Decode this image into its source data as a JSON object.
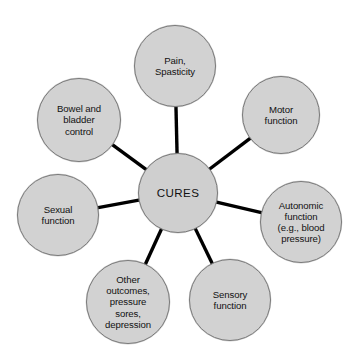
{
  "diagram": {
    "type": "hub-and-spoke",
    "colors": {
      "node_fill": "#d2d2d2",
      "node_stroke": "#7a7a7a",
      "spoke": "#000000",
      "background": "#ffffff",
      "text": "#111111"
    },
    "center": {
      "label": "CURES",
      "cx": 178,
      "cy": 193,
      "r": 40
    },
    "nodes": [
      {
        "id": "pain-spasticity",
        "label": "Pain,\nSpasticity",
        "lines": [
          "Pain,",
          "Spasticity"
        ],
        "cx": 175,
        "cy": 66,
        "r": 41
      },
      {
        "id": "motor-function",
        "label": "Motor\nfunction",
        "lines": [
          "Motor",
          "function"
        ],
        "cx": 281,
        "cy": 115,
        "r": 39
      },
      {
        "id": "autonomic-function",
        "label": "Autonomic\nfunction\n(e.g., blood\npressure)",
        "lines": [
          "Autonomic",
          "function",
          "(e.g., blood",
          "pressure)"
        ],
        "cx": 301,
        "cy": 222,
        "r": 41
      },
      {
        "id": "sensory-function",
        "label": "Sensory\nfunction",
        "lines": [
          "Sensory",
          "function"
        ],
        "cx": 230,
        "cy": 300,
        "r": 41
      },
      {
        "id": "other-outcomes",
        "label": "Other\noutcomes,\npressure\nsores,\ndepression",
        "lines": [
          "Other",
          "outcomes,",
          "pressure",
          "sores,",
          "depression"
        ],
        "cx": 128,
        "cy": 302,
        "r": 42
      },
      {
        "id": "sexual-function",
        "label": "Sexual\nfunction",
        "lines": [
          "Sexual",
          "function"
        ],
        "cx": 58,
        "cy": 215,
        "r": 41
      },
      {
        "id": "bowel-bladder-control",
        "label": "Bowel and\nbladder\ncontrol",
        "lines": [
          "Bowel and",
          "bladder",
          "control"
        ],
        "cx": 79,
        "cy": 120,
        "r": 42
      }
    ]
  }
}
